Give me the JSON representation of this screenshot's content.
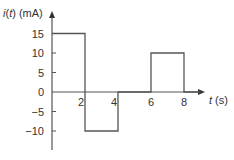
{
  "chart_data": {
    "type": "line",
    "subtype": "piecewise-constant step waveform",
    "title": "",
    "xlabel": "t (s)",
    "ylabel": "i(t) (mA)",
    "xlim": [
      0,
      9
    ],
    "ylim": [
      -15,
      18
    ],
    "x_ticks": [
      2,
      4,
      6,
      8
    ],
    "x_tick_labels": [
      "2",
      "4",
      "6",
      "8"
    ],
    "y_ticks": [
      15,
      10,
      5,
      0,
      -5,
      -10
    ],
    "y_tick_labels": [
      "15",
      "10",
      "5",
      "0",
      "−5",
      "−10"
    ],
    "grid": false,
    "legend": null,
    "series": [
      {
        "name": "i(t)",
        "segments": [
          {
            "t_start": 0,
            "t_end": 2,
            "value": 15
          },
          {
            "t_start": 2,
            "t_end": 4,
            "value": -10
          },
          {
            "t_start": 4,
            "t_end": 6,
            "value": 0
          },
          {
            "t_start": 6,
            "t_end": 8,
            "value": 10
          },
          {
            "t_start": 8,
            "t_end": 9,
            "value": 0
          }
        ],
        "x": [
          0,
          2,
          2,
          4,
          4,
          6,
          6,
          8,
          8,
          9
        ],
        "y": [
          15,
          15,
          -10,
          -10,
          0,
          0,
          10,
          10,
          0,
          0
        ]
      }
    ],
    "colors": {
      "line": "#555555",
      "axis": "#555555",
      "text": "#333333"
    }
  },
  "labels": {
    "y_axis_title": "i(t) (mA)",
    "y_axis_title_italic_part": "i",
    "y_axis_title_t": "t",
    "x_axis_title_italic_part": "t",
    "x_axis_title_unit": " (s)"
  }
}
